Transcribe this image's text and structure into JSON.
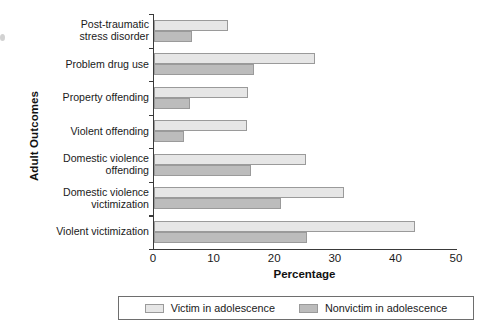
{
  "chart_data": {
    "type": "bar",
    "orientation": "horizontal",
    "title": "",
    "xlabel": "Percentage",
    "ylabel": "Adult Outcomes",
    "xlim": [
      0,
      50
    ],
    "xticks": [
      0,
      10,
      20,
      30,
      40,
      50
    ],
    "grid": false,
    "legend_position": "bottom",
    "categories": [
      "Post-traumatic stress disorder",
      "Problem drug use",
      "Property offending",
      "Violent offending",
      "Domestic violence offending",
      "Domestic violence victimization",
      "Violent victimization"
    ],
    "category_lines": [
      [
        "Post-traumatic",
        "stress disorder"
      ],
      [
        "Problem drug use"
      ],
      [
        "Property offending"
      ],
      [
        "Violent offending"
      ],
      [
        "Domestic violence",
        "offending"
      ],
      [
        "Domestic violence",
        "victimization"
      ],
      [
        "Violent victimization"
      ]
    ],
    "series": [
      {
        "name": "Victim in adolescence",
        "color": "#e6e6e6",
        "values": [
          12.2,
          26.5,
          15.5,
          15.3,
          25.0,
          31.3,
          43.0
        ]
      },
      {
        "name": "Nonvictim in adolescence",
        "color": "#bcbcbc",
        "values": [
          6.2,
          16.5,
          6.0,
          5.0,
          16.0,
          21.0,
          25.3
        ]
      }
    ]
  },
  "legend": {
    "entries": [
      {
        "label": "Victim in adolescence"
      },
      {
        "label": "Nonvictim in adolescence"
      }
    ]
  }
}
